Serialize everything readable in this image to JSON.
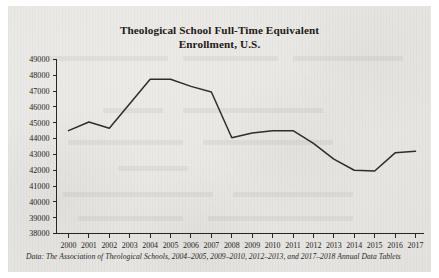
{
  "title": {
    "line1": "Theological School Full-Time Equivalent",
    "line2": "Enrollment, U.S."
  },
  "footnote": "Data: The Association of Theological Schools, 2004–2005, 2009–2010, 2012–2013, and 2017–2018 Annual Data Tablets",
  "colors": {
    "paper": "#e7e5e1",
    "ink": "#2a251f",
    "series": "#312c25"
  },
  "chart_data": {
    "type": "line",
    "title": "Theological School Full-Time Equivalent Enrollment, U.S.",
    "xlabel": "",
    "ylabel": "",
    "grid": false,
    "legend": "none",
    "xlim": [
      2000,
      2017
    ],
    "ylim": [
      38000,
      49000
    ],
    "ytick_step": 1000,
    "yticks": [
      38000,
      39000,
      40000,
      41000,
      42000,
      43000,
      44000,
      45000,
      46000,
      47000,
      48000,
      49000
    ],
    "ytick_labels": [
      "38000",
      "39000",
      "40000",
      "41000",
      "42000",
      "43000",
      "44000",
      "45000",
      "46000",
      "47000",
      "48000",
      "49000"
    ],
    "categories": [
      2000,
      2001,
      2002,
      2003,
      2004,
      2005,
      2006,
      2007,
      2008,
      2009,
      2010,
      2011,
      2012,
      2013,
      2014,
      2015,
      2016,
      2017
    ],
    "xtick_labels": [
      "2000",
      "2001",
      "2002",
      "2003",
      "2004",
      "2005",
      "2006",
      "2007",
      "2008",
      "2009",
      "2010",
      "2011",
      "2012",
      "2013",
      "2014",
      "2015",
      "2016",
      "2017"
    ],
    "series": [
      {
        "name": "Full-Time Equivalent Enrollment",
        "values": [
          44500,
          45050,
          44650,
          46200,
          47750,
          47750,
          47300,
          46950,
          44050,
          44350,
          44500,
          44500,
          43700,
          42700,
          42000,
          41950,
          43100,
          43200
        ]
      }
    ]
  }
}
